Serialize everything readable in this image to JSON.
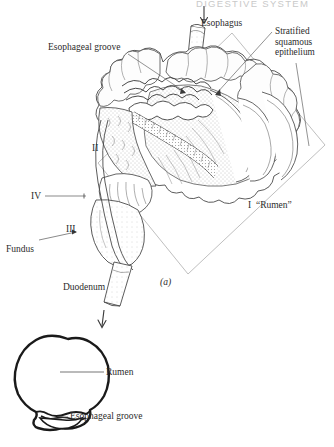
{
  "page": {
    "header": "DIGESTIVE SYSTEM",
    "figure_label_a": "(a)",
    "background": "#ffffff",
    "ink": "#2b2b2b"
  },
  "figure_a": {
    "name": "ruminant-stomach-cutaway",
    "labels": {
      "esophagus": "Esophagus",
      "stratified_squamous_epithelium": "Stratified\nsquamous\nepithelium",
      "esophageal_groove": "Esophageal groove",
      "compartment_ii": "II",
      "compartment_iv": "IV",
      "compartment_iii": "III",
      "fundus": "Fundus",
      "duodenum": "Duodenum",
      "compartment_i_rumen": "I  “Rumen”"
    }
  },
  "figure_b": {
    "name": "rumen-cross-section",
    "labels": {
      "rumen": "Rumen",
      "esophageal_groove": "Esophageal groove"
    }
  }
}
